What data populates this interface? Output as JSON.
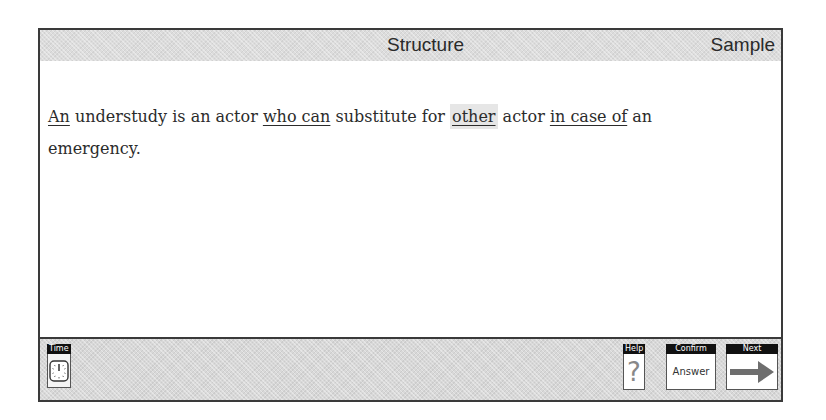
{
  "header": {
    "title": "Structure",
    "mode_label": "Sample"
  },
  "question": {
    "segments": [
      {
        "text": "An",
        "underlined": true
      },
      {
        "text": " understudy is an actor ",
        "underlined": false
      },
      {
        "text": "who can",
        "underlined": true
      },
      {
        "text": " substitute for ",
        "underlined": false
      },
      {
        "text": "other",
        "underlined": true,
        "selected": true
      },
      {
        "text": " actor ",
        "underlined": false
      },
      {
        "text": "in case of",
        "underlined": true
      },
      {
        "text": " an emergency.",
        "underlined": false
      }
    ]
  },
  "footer": {
    "time": {
      "label": "Time",
      "icon": "clock-icon"
    },
    "help": {
      "label": "Help",
      "glyph": "?",
      "icon": "question-mark-icon"
    },
    "confirm": {
      "label": "Confirm",
      "body": "Answer"
    },
    "next": {
      "label": "Next",
      "icon": "right-arrow-icon"
    }
  },
  "colors": {
    "frame": "#3a3a3a",
    "header_bg": "#dcdcdc",
    "selected_bg": "#e6e6e6",
    "arrow": "#6e6e6e"
  }
}
